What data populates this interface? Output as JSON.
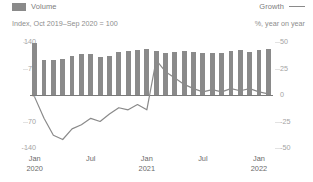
{
  "legend": {
    "volume_label": "Volume",
    "growth_label": "Growth",
    "volume_swatch_color": "#8a8a8a",
    "growth_swatch_color": "#8a8a8a"
  },
  "subtitle": "Index, Oct 2019–Sep 2020 = 100",
  "unit_right": "%, year on year",
  "axis": {
    "left_ticks": [
      "140",
      "70",
      "0",
      "-70",
      "-140"
    ],
    "right_ticks": [
      "50",
      "25",
      "0",
      "-25",
      "-50"
    ],
    "x_ticks": [
      {
        "month": "Jan",
        "year": "2020"
      },
      {
        "month": "Jul",
        "year": ""
      },
      {
        "month": "Jan",
        "year": "2021"
      },
      {
        "month": "Jul",
        "year": ""
      },
      {
        "month": "Jan",
        "year": "2022"
      }
    ]
  },
  "chart_data": {
    "type": "bar",
    "title": "",
    "subtitle": "Index, Oct 2019–Sep 2020 = 100",
    "xlabel": "",
    "ylabel": "Index, Oct 2019-Sep 2020 = 100",
    "y2label": "%, year on year",
    "ylim": [
      -140,
      140
    ],
    "y2lim": [
      -50,
      50
    ],
    "grid": false,
    "legend_position": "top",
    "categories": [
      "Jan 2020",
      "Feb 2020",
      "Mar 2020",
      "Apr 2020",
      "May 2020",
      "Jun 2020",
      "Jul 2020",
      "Aug 2020",
      "Sep 2020",
      "Oct 2020",
      "Nov 2020",
      "Dec 2020",
      "Jan 2021",
      "Feb 2021",
      "Mar 2021",
      "Apr 2021",
      "May 2021",
      "Jun 2021",
      "Jul 2021",
      "Aug 2021",
      "Sep 2021",
      "Oct 2021",
      "Nov 2021",
      "Dec 2021",
      "Jan 2022",
      "Feb 2022"
    ],
    "series": [
      {
        "name": "Volume",
        "type": "bar",
        "axis": "left",
        "color": "#8a8a8a",
        "values": [
          138,
          92,
          93,
          95,
          104,
          108,
          108,
          101,
          103,
          113,
          116,
          118,
          121,
          115,
          110,
          114,
          116,
          114,
          110,
          112,
          112,
          117,
          120,
          113,
          118,
          122
        ]
      },
      {
        "name": "Growth",
        "type": "line",
        "axis": "right",
        "color": "#8a8a8a",
        "values": [
          -2,
          -22,
          -38,
          -42,
          -32,
          -28,
          -22,
          -25,
          -18,
          -12,
          -14,
          -9,
          -14,
          33,
          22,
          16,
          10,
          6,
          3,
          5,
          3,
          6,
          4,
          6,
          3,
          1
        ]
      }
    ]
  }
}
